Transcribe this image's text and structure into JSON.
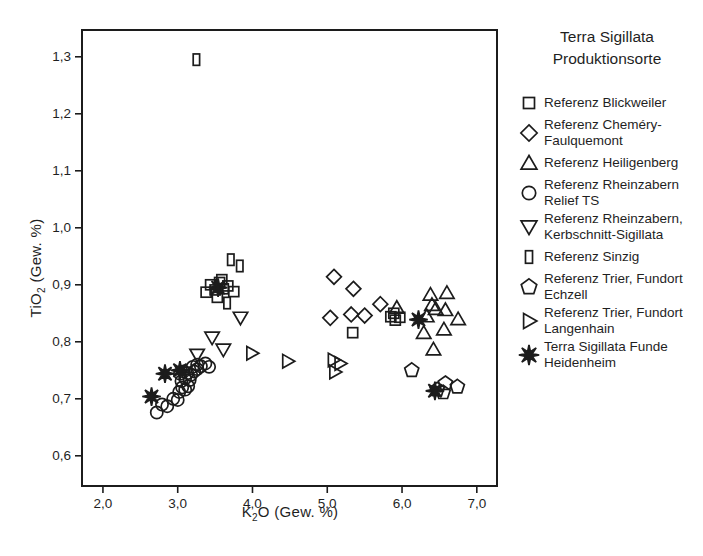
{
  "legend": {
    "title_line1": "Terra Sigillata",
    "title_line2": "Produktionsorte",
    "items": [
      {
        "marker": "square",
        "label": "Referenz Blickweiler",
        "lines": 1
      },
      {
        "marker": "diamond",
        "label": "Referenz Cheméry-Faulquemont",
        "lines": 2
      },
      {
        "marker": "triangle-up",
        "label": "Referenz Heiligenberg",
        "lines": 1
      },
      {
        "marker": "circle",
        "label": "Referenz Rheinzabern Relief TS",
        "lines": 2
      },
      {
        "marker": "triangle-down",
        "label": "Referenz Rheinzabern, Kerbschnitt-Sigillata",
        "lines": 2
      },
      {
        "marker": "vrect",
        "label": "Referenz Sinzig",
        "lines": 1
      },
      {
        "marker": "pentagon",
        "label": "Referenz Trier, Fundort Echzell",
        "lines": 2
      },
      {
        "marker": "triangle-right",
        "label": "Referenz Trier, Fundort Langenhain",
        "lines": 2
      },
      {
        "marker": "star8",
        "label": "Terra Sigillata Funde Heidenheim",
        "lines": 2
      }
    ]
  },
  "chart_data": {
    "type": "scatter",
    "title": "",
    "xlabel": {
      "pre": "K",
      "sub": "2",
      "post": "O (Gew. %)"
    },
    "ylabel": {
      "pre": "TiO",
      "sub": "2",
      "post": " (Gew. %)"
    },
    "xlim": [
      1.72,
      7.27
    ],
    "ylim": [
      0.547,
      1.347
    ],
    "x_ticks": {
      "values": [
        2.0,
        3.0,
        4.0,
        5.0,
        6.0,
        7.0
      ],
      "labels": [
        "2,0",
        "3,0",
        "4,0",
        "5,0",
        "6,0",
        "7,0"
      ]
    },
    "y_ticks": {
      "values": [
        0.6,
        0.7,
        0.8,
        0.9,
        1.0,
        1.1,
        1.2,
        1.3
      ],
      "labels": [
        "0,6",
        "0,7",
        "0,8",
        "0,9",
        "1,0",
        "1,1",
        "1,2",
        "1,3"
      ]
    },
    "grid": false,
    "legend_position": "right",
    "marker_color": "#1c1c1c",
    "series": [
      {
        "name": "Referenz Blickweiler",
        "marker": "square",
        "points": [
          [
            3.38,
            0.887
          ],
          [
            3.44,
            0.9
          ],
          [
            3.5,
            0.891
          ],
          [
            3.56,
            0.904
          ],
          [
            3.61,
            0.893
          ],
          [
            3.67,
            0.898
          ],
          [
            3.75,
            0.888
          ],
          [
            3.53,
            0.878
          ],
          [
            3.59,
            0.909
          ],
          [
            5.34,
            0.816
          ],
          [
            5.85,
            0.844
          ],
          [
            5.91,
            0.838
          ],
          [
            5.97,
            0.843
          ],
          [
            5.89,
            0.85
          ]
        ]
      },
      {
        "name": "Referenz Cheméry-Faulquemont",
        "marker": "diamond",
        "points": [
          [
            5.09,
            0.914
          ],
          [
            5.35,
            0.893
          ],
          [
            5.71,
            0.866
          ],
          [
            5.04,
            0.842
          ],
          [
            5.32,
            0.848
          ],
          [
            5.5,
            0.846
          ]
        ]
      },
      {
        "name": "Referenz Heiligenberg",
        "marker": "triangle-up",
        "points": [
          [
            5.93,
            0.86
          ],
          [
            6.38,
            0.883
          ],
          [
            6.6,
            0.886
          ],
          [
            6.4,
            0.865
          ],
          [
            6.45,
            0.858
          ],
          [
            6.58,
            0.856
          ],
          [
            6.75,
            0.84
          ],
          [
            6.33,
            0.845
          ],
          [
            6.29,
            0.816
          ],
          [
            6.56,
            0.822
          ],
          [
            6.42,
            0.787
          ]
        ]
      },
      {
        "name": "Referenz Rheinzabern Relief TS",
        "marker": "circle",
        "points": [
          [
            2.72,
            0.676
          ],
          [
            2.79,
            0.69
          ],
          [
            2.86,
            0.687
          ],
          [
            2.94,
            0.7
          ],
          [
            3.0,
            0.698
          ],
          [
            3.02,
            0.712
          ],
          [
            3.06,
            0.72
          ],
          [
            3.1,
            0.716
          ],
          [
            3.14,
            0.722
          ],
          [
            3.05,
            0.731
          ],
          [
            3.1,
            0.736
          ],
          [
            3.16,
            0.733
          ],
          [
            3.03,
            0.744
          ],
          [
            3.08,
            0.748
          ],
          [
            3.13,
            0.745
          ],
          [
            3.18,
            0.742
          ],
          [
            3.22,
            0.748
          ],
          [
            3.26,
            0.752
          ],
          [
            3.2,
            0.756
          ],
          [
            3.26,
            0.76
          ],
          [
            3.31,
            0.757
          ],
          [
            3.37,
            0.762
          ],
          [
            3.42,
            0.756
          ]
        ]
      },
      {
        "name": "Referenz Rheinzabern, Kerbschnitt-Sigillata",
        "marker": "triangle-down",
        "points": [
          [
            3.26,
            0.777
          ],
          [
            3.46,
            0.807
          ],
          [
            3.61,
            0.786
          ],
          [
            3.84,
            0.842
          ]
        ]
      },
      {
        "name": "Referenz Sinzig",
        "marker": "vrect",
        "points": [
          [
            3.25,
            1.295
          ],
          [
            3.71,
            0.944
          ],
          [
            3.83,
            0.933
          ],
          [
            3.66,
            0.868
          ]
        ]
      },
      {
        "name": "Referenz Trier, Fundort Echzell",
        "marker": "pentagon",
        "points": [
          [
            6.13,
            0.75
          ],
          [
            6.58,
            0.727
          ],
          [
            6.74,
            0.721
          ],
          [
            6.47,
            0.716
          ],
          [
            6.55,
            0.711
          ]
        ]
      },
      {
        "name": "Referenz Trier, Fundort Langenhain",
        "marker": "triangle-right",
        "points": [
          [
            3.99,
            0.78
          ],
          [
            4.47,
            0.766
          ],
          [
            5.08,
            0.768
          ],
          [
            5.17,
            0.762
          ],
          [
            5.1,
            0.747
          ]
        ]
      },
      {
        "name": "Terra Sigillata Funde Heidenheim",
        "marker": "star8",
        "points": [
          [
            2.65,
            0.704
          ],
          [
            2.83,
            0.744
          ],
          [
            3.03,
            0.75
          ],
          [
            3.54,
            0.895
          ],
          [
            6.22,
            0.839
          ],
          [
            6.44,
            0.714
          ]
        ]
      }
    ]
  }
}
